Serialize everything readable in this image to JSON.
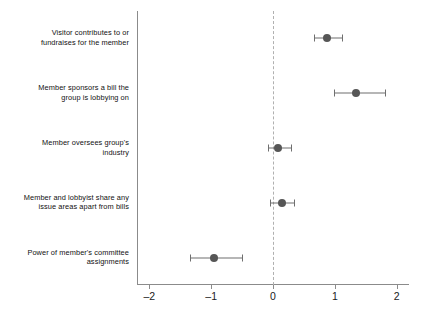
{
  "chart_data": {
    "type": "scatter",
    "title": "",
    "subtitle": "",
    "xlabel": "",
    "ylabel": "",
    "xlim": [
      -2.2,
      2.2
    ],
    "xticks": [
      -2,
      -1,
      0,
      1,
      2
    ],
    "xticklabels": [
      "–2",
      "–1",
      "0",
      "1",
      "2"
    ],
    "grid": false,
    "legend": null,
    "reference_line": {
      "x": 0,
      "style": "dashed",
      "color": "#b0b0b0"
    },
    "point_color": "#565656",
    "errorbar_color": "#6f6f6f",
    "axis_color": "#8b8b8b",
    "orientation": "horizontal",
    "categories": [
      "Visitor contributes to or\nfundraises for the member",
      "Member sponsors a bill the\ngroup is lobbying on",
      "Member oversees group's\nindustry",
      "Member and lobbyist share any\nissue areas apart from bills",
      "Power of member's committee\nassignments"
    ],
    "points": [
      {
        "label": "Visitor contributes to or fundraises for the member",
        "estimate": 0.87,
        "ci_low": 0.66,
        "ci_high": 1.11
      },
      {
        "label": "Member sponsors a bill the group is lobbying on",
        "estimate": 1.34,
        "ci_low": 0.99,
        "ci_high": 1.81
      },
      {
        "label": "Member oversees group's industry",
        "estimate": 0.08,
        "ci_low": -0.08,
        "ci_high": 0.29
      },
      {
        "label": "Member and lobbyist share any issue areas apart from bills",
        "estimate": 0.14,
        "ci_low": -0.05,
        "ci_high": 0.34
      },
      {
        "label": "Power of member's committee assignments",
        "estimate": -0.96,
        "ci_low": -1.34,
        "ci_high": -0.5
      }
    ]
  }
}
